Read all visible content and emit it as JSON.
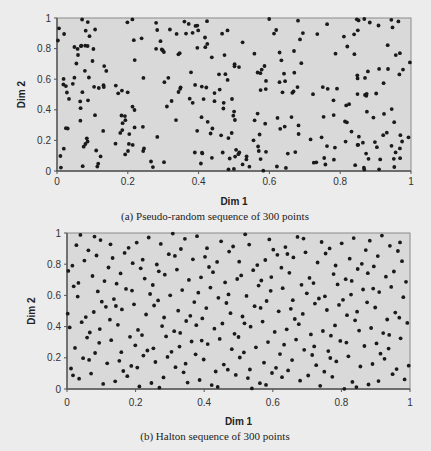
{
  "chart_data": [
    {
      "type": "scatter",
      "id": "pseudo-random",
      "caption": "(a) Pseudo-random sequence of 300 points",
      "xlabel": "Dim 1",
      "ylabel": "Dim 2",
      "xlim": [
        0,
        1
      ],
      "ylim": [
        0,
        1
      ],
      "x_ticks": [
        "0",
        "0.2",
        "0.4",
        "0.6",
        "0.8",
        "1"
      ],
      "y_ticks": [
        "0",
        "0.2",
        "0.4",
        "0.6",
        "0.8",
        "1"
      ],
      "grid": false,
      "legend": null,
      "n_points": 300,
      "generator": "pseudo-random uniform",
      "plot_background": "#d9d9d9",
      "marker_color": "#1a1a1a",
      "layout": {
        "left": 57,
        "top": 18,
        "right": 411,
        "bottom": 171,
        "xtick_y": 185,
        "xlabel_y": 205,
        "caption_y": 220
      }
    },
    {
      "type": "scatter",
      "id": "halton",
      "caption": "(b) Halton sequence of 300 points",
      "xlabel": "Dim 1",
      "ylabel": "Dim 2",
      "xlim": [
        0,
        1
      ],
      "ylim": [
        0,
        1
      ],
      "x_ticks": [
        "0",
        "0.2",
        "0.4",
        "0.6",
        "0.8",
        "1"
      ],
      "y_ticks": [
        "0",
        "0.2",
        "0.4",
        "0.6",
        "0.8",
        "1"
      ],
      "grid": false,
      "legend": null,
      "n_points": 300,
      "generator": "Halton sequence, bases 2 and 3",
      "plot_background": "#d9d9d9",
      "marker_color": "#1a1a1a",
      "layout": {
        "left": 67,
        "top": 233,
        "right": 410,
        "bottom": 389,
        "xtick_y": 406,
        "xlabel_y": 425,
        "caption_y": 440
      }
    }
  ]
}
